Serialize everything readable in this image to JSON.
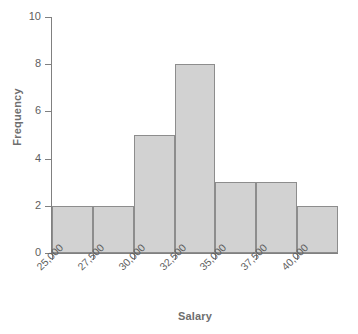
{
  "chart_data": {
    "type": "bar",
    "title": "",
    "subtitle": "",
    "xlabel": "Salary",
    "ylabel": "Frequency",
    "categories": [
      "25,000-27,500",
      "27,500-30,000",
      "30,000-32,500",
      "32,500-35,000",
      "35,000-37,500",
      "37,500-40,000",
      "40,000-42,500"
    ],
    "bin_edges": [
      25000,
      27500,
      30000,
      32500,
      35000,
      37500,
      40000,
      42500
    ],
    "values": [
      2,
      2,
      5,
      8,
      3,
      3,
      2
    ],
    "xlim": [
      25000,
      42500
    ],
    "ylim": [
      0,
      10
    ],
    "xtick_labels": [
      "25,000",
      "27,500",
      "30,000",
      "32,500",
      "35,000",
      "37,500",
      "40,000"
    ],
    "xtick_values": [
      25000,
      27500,
      30000,
      32500,
      35000,
      37500,
      40000
    ],
    "ytick_labels": [
      "0",
      "2",
      "4",
      "6",
      "8",
      "10"
    ],
    "ytick_values": [
      0,
      2,
      4,
      6,
      8,
      10
    ],
    "grid": false,
    "legend": false,
    "legend_position": "none",
    "bar_fill_color": "#d2d2d2",
    "bar_border_color": "#8d8d8d",
    "axis_color": "#808080",
    "label_color": "#6e6e6e",
    "tick_label_color": "#5e5e5e",
    "background_color": "#ffffff",
    "xtick_label_rotation": -45
  }
}
